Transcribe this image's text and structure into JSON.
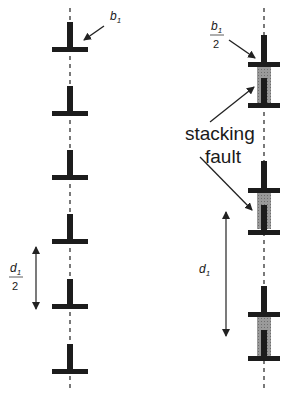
{
  "diagram": {
    "left_column": {
      "burgers_label": {
        "symbol": "b",
        "subscript": "1"
      },
      "spacing_label": {
        "numerator_symbol": "d",
        "numerator_subscript": "1",
        "denominator": "2"
      },
      "dislocation_count": 6
    },
    "right_column": {
      "burgers_label": {
        "symbol": "b",
        "subscript": "1",
        "denominator": "2"
      },
      "fault_label_line1": "stacking",
      "fault_label_line2": "fault",
      "spacing_label": {
        "symbol": "d",
        "subscript": "1"
      },
      "partial_pair_count": 3
    },
    "colors": {
      "dislocation": "#1c1c1c",
      "fault_fill": "#8a8a8a",
      "line": "#222222"
    }
  }
}
